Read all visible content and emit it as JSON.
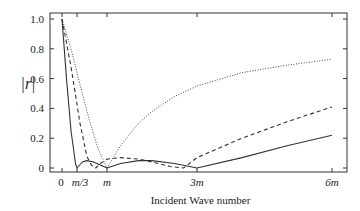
{
  "chart_data": {
    "type": "line",
    "title": "",
    "xlabel": "Incident Wave number",
    "ylabel": "|r|",
    "x_tick_labels": [
      "0",
      "m/3",
      "m",
      "3m",
      "6m"
    ],
    "x_tick_values_in_m": [
      0,
      0.3333,
      1,
      3,
      6
    ],
    "y_tick_labels": [
      "0",
      "0.2",
      "0.4",
      "0.6",
      "0.8",
      "1.0"
    ],
    "ylim": [
      0,
      1.0
    ],
    "xlim_in_m": [
      -0.27,
      6.3
    ],
    "grid": false,
    "legend": null,
    "series": [
      {
        "name": "solid",
        "style": "solid",
        "x_in_m": [
          0,
          0.1,
          0.2,
          0.3,
          0.3333,
          0.45,
          0.55,
          0.7,
          0.85,
          1.0,
          1.3,
          1.7,
          2.0,
          2.5,
          3.0,
          4.0,
          5.0,
          6.0
        ],
        "values": [
          1.0,
          0.6,
          0.25,
          0.03,
          0.0,
          0.04,
          0.05,
          0.04,
          0.02,
          0.0,
          0.03,
          0.05,
          0.05,
          0.03,
          0.0,
          0.07,
          0.15,
          0.22
        ]
      },
      {
        "name": "dashed",
        "style": "dashed",
        "x_in_m": [
          0,
          0.2,
          0.4,
          0.55,
          0.65,
          0.75,
          0.85,
          1.0,
          1.3,
          1.7,
          2.0,
          2.4,
          2.7,
          3.0,
          4.0,
          5.0,
          6.0
        ],
        "values": [
          1.0,
          0.68,
          0.3,
          0.08,
          0.02,
          0.0,
          0.03,
          0.06,
          0.07,
          0.06,
          0.04,
          0.01,
          0.0,
          0.07,
          0.2,
          0.31,
          0.41
        ]
      },
      {
        "name": "dotted",
        "style": "dotted",
        "x_in_m": [
          0,
          0.2,
          0.4,
          0.6,
          0.8,
          1.0,
          1.3,
          1.7,
          2.0,
          2.5,
          3.0,
          4.0,
          5.0,
          6.0
        ],
        "values": [
          1.0,
          0.8,
          0.56,
          0.33,
          0.13,
          0.0,
          0.15,
          0.3,
          0.38,
          0.48,
          0.55,
          0.64,
          0.69,
          0.73
        ]
      }
    ]
  }
}
